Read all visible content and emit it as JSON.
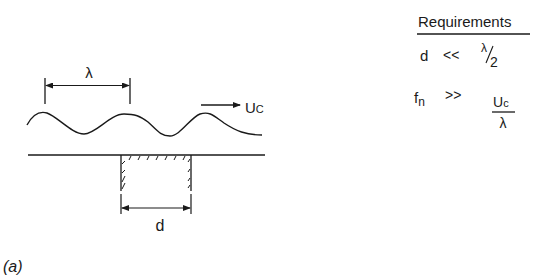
{
  "figure": {
    "caption": "(a)",
    "schematic": {
      "wavelength_label": "λ",
      "convection_label_main": "U",
      "convection_label_sub": "C",
      "cavity_width_label": "d"
    },
    "requirements": {
      "title": "Requirements",
      "rows": [
        {
          "lhs": "d",
          "op": "<<",
          "rhs_num": "λ",
          "rhs_den": "2",
          "rhs_style": "slash-fraction"
        },
        {
          "lhs_main": "f",
          "lhs_sub": "n",
          "op": ">>",
          "rhs_num_main": "U",
          "rhs_num_sub": "c",
          "rhs_den": "λ",
          "rhs_style": "stacked-fraction"
        }
      ]
    },
    "colors": {
      "ink": "#1a1a1a",
      "background": "#ffffff"
    }
  }
}
